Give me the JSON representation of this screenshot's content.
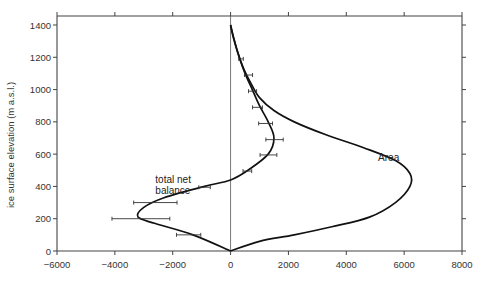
{
  "chart_data": {
    "type": "line",
    "title": "",
    "xlabel": "",
    "ylabel": "ice surface elevation (m a.s.l.)",
    "xlim": [
      -6000,
      8000
    ],
    "ylim": [
      0,
      1450
    ],
    "x_ticks": [
      -6000,
      -4000,
      -2000,
      0,
      2000,
      4000,
      6000,
      8000
    ],
    "x_tick_labels": [
      "-6000",
      "-4000",
      "-2000",
      "0",
      "2000",
      "4000",
      "6000",
      "8000"
    ],
    "y_ticks": [
      0,
      200,
      400,
      600,
      800,
      1000,
      1200,
      1400
    ],
    "y_tick_labels": [
      "0",
      "200",
      "400",
      "600",
      "800",
      "1000",
      "1200",
      "1400"
    ],
    "grid": false,
    "legend": null,
    "annotations": [
      {
        "text_lines": [
          "total net",
          "balance"
        ],
        "x": -2600,
        "y": 420
      },
      {
        "text": "Area",
        "x": 5100,
        "y": 560
      }
    ],
    "series": [
      {
        "name": "total net balance",
        "x": [
          0,
          -1300,
          -2600,
          -3200,
          -3000,
          -2300,
          -900,
          0,
          600,
          1300,
          1500,
          1300,
          1000,
          750,
          500,
          300,
          100,
          0
        ],
        "y": [
          0,
          100,
          170,
          210,
          270,
          330,
          400,
          440,
          500,
          600,
          700,
          800,
          900,
          1000,
          1100,
          1200,
          1320,
          1400
        ],
        "error_bars": [
          {
            "y": 100,
            "x": -1450,
            "xerr": 420
          },
          {
            "y": 200,
            "x": -3100,
            "xerr": 1000
          },
          {
            "y": 300,
            "x": -2600,
            "xerr": 750
          },
          {
            "y": 395,
            "x": -900,
            "xerr": 200
          },
          {
            "y": 495,
            "x": 580,
            "xerr": 150
          },
          {
            "y": 595,
            "x": 1310,
            "xerr": 290
          },
          {
            "y": 690,
            "x": 1520,
            "xerr": 300
          },
          {
            "y": 790,
            "x": 1210,
            "xerr": 240
          },
          {
            "y": 890,
            "x": 930,
            "xerr": 170
          },
          {
            "y": 990,
            "x": 760,
            "xerr": 140
          },
          {
            "y": 1090,
            "x": 620,
            "xerr": 140
          },
          {
            "y": 1190,
            "x": 360,
            "xerr": 80
          }
        ]
      },
      {
        "name": "Area",
        "x": [
          0,
          1000,
          2200,
          3500,
          4800,
          5700,
          6200,
          6200,
          5700,
          4600,
          3300,
          2200,
          1500,
          1000,
          700,
          450,
          250,
          80,
          0
        ],
        "y": [
          0,
          60,
          100,
          150,
          210,
          300,
          400,
          480,
          560,
          640,
          720,
          800,
          870,
          950,
          1040,
          1130,
          1230,
          1340,
          1400
        ]
      }
    ]
  }
}
